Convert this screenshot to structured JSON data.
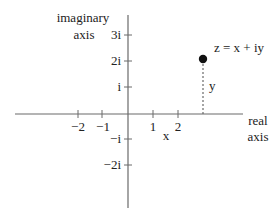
{
  "diagram": {
    "colors": {
      "background": "#ffffff",
      "axis": "#6a6a6a",
      "text": "#222222",
      "point": "#111111"
    },
    "vertical_axis": {
      "label_line1": "imaginary",
      "label_line2": "axis",
      "ticks": [
        {
          "label": "3i",
          "y": 35
        },
        {
          "label": "2i",
          "y": 61
        },
        {
          "label": "i",
          "y": 87
        },
        {
          "label": "−i",
          "y": 139
        },
        {
          "label": "−2i",
          "y": 165
        }
      ]
    },
    "horizontal_axis": {
      "label_line1": "real",
      "label_line2": "axis",
      "ticks": [
        {
          "label": "−2",
          "x": 78
        },
        {
          "label": "−1",
          "x": 102
        },
        {
          "label": "1",
          "x": 153
        },
        {
          "label": "2",
          "x": 178
        }
      ]
    },
    "point": {
      "label": "z = x + iy",
      "x_label": "x",
      "y_label": "y"
    }
  }
}
